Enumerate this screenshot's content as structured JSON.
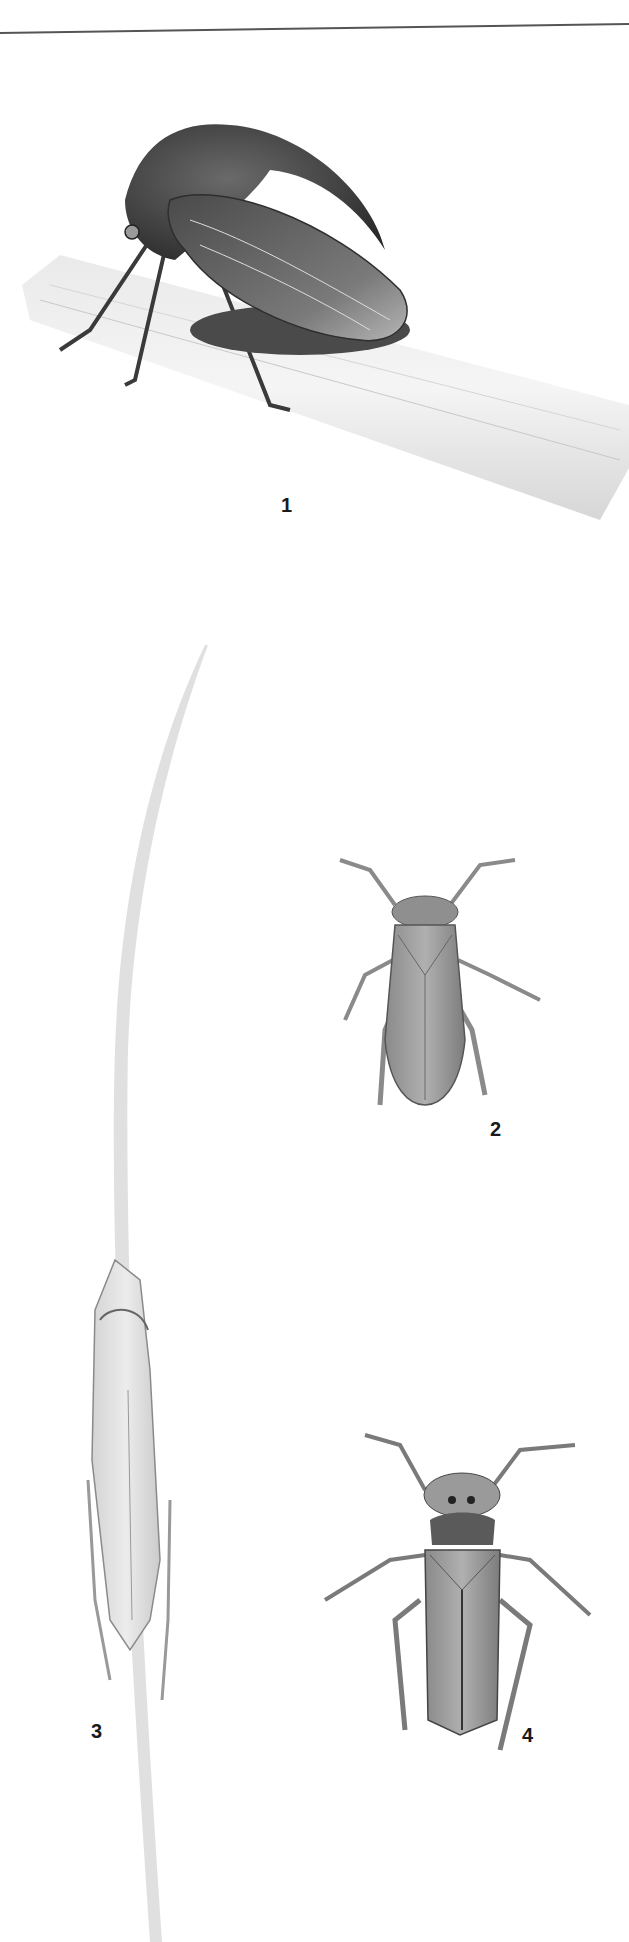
{
  "plate": {
    "figures": [
      {
        "label": "1",
        "subject": "treehopper-on-stem"
      },
      {
        "label": "2",
        "subject": "leafhopper-dorsal"
      },
      {
        "label": "3",
        "subject": "leafhopper-on-grass-blade"
      },
      {
        "label": "4",
        "subject": "spotted-leafhopper-dorsal"
      }
    ]
  }
}
